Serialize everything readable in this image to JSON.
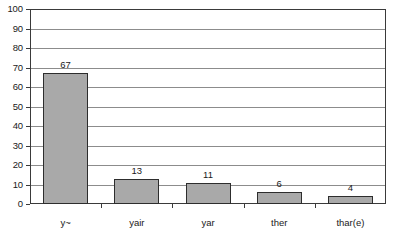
{
  "chart_data": {
    "type": "bar",
    "title": "",
    "subtitle": "",
    "xlabel": "",
    "ylabel": "",
    "categories": [
      "y~",
      "yair",
      "yar",
      "ther",
      "thar(e)"
    ],
    "values": [
      67,
      13,
      11,
      6,
      4
    ],
    "value_labels": [
      "67",
      "13",
      "11",
      "6",
      "4"
    ],
    "ylim": [
      0,
      100
    ],
    "ytick_step": 10,
    "ytick_labels": [
      "0",
      "10",
      "20",
      "30",
      "40",
      "50",
      "60",
      "70",
      "80",
      "90",
      "100"
    ],
    "grid": "horizontal",
    "legend": "none",
    "series": [
      {
        "name": "",
        "values": [
          67,
          13,
          11,
          6,
          4
        ]
      }
    ]
  },
  "style": {
    "bar_fill": "#a9a9a9",
    "bar_stroke": "#2d2d2d",
    "gridline_color": "#8c8c8c",
    "frame_color": "#3a3a3a",
    "background": "#ffffff",
    "text_color": "#1a1a1a"
  }
}
